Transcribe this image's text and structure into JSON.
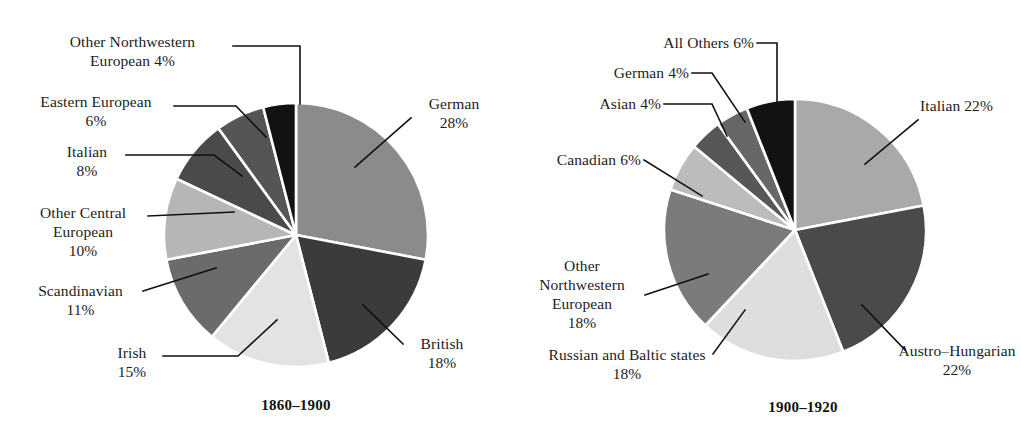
{
  "figure": {
    "background": "#ffffff",
    "leader_line_color": "#111111",
    "slice_border_color": "#ffffff",
    "text_color": "#1c1c1c"
  },
  "chart_data": [
    {
      "type": "pie",
      "title": "1860–1900",
      "xlabel": "",
      "ylabel": "",
      "legend_position": "callout-labels",
      "grid": false,
      "start_angle_deg": 0,
      "direction": "clockwise",
      "center": [
        296,
        235
      ],
      "radius": 132,
      "categories": [
        "German",
        "British",
        "Irish",
        "Scandinavian",
        "Other Central European",
        "Italian",
        "Eastern European",
        "Other Northwestern European"
      ],
      "values": [
        28,
        18,
        15,
        11,
        10,
        8,
        6,
        4
      ],
      "value_labels": [
        "28%",
        "18%",
        "15%",
        "11%",
        "10%",
        "8%",
        "6%",
        "4%"
      ],
      "colors": [
        "#8b8b8b",
        "#3b3b3b",
        "#e3e3e3",
        "#6b6b6b",
        "#b6b6b6",
        "#4a4a4a",
        "#555555",
        "#121212"
      ],
      "labels": [
        {
          "name": "German",
          "pct": "28%",
          "text": "German\n28%",
          "align": "center"
        },
        {
          "name": "British",
          "pct": "18%",
          "text": "British\n18%",
          "align": "center"
        },
        {
          "name": "Irish",
          "pct": "15%",
          "text": "Irish\n15%",
          "align": "center"
        },
        {
          "name": "Scandinavian",
          "pct": "11%",
          "text": "Scandinavian\n11%",
          "align": "center"
        },
        {
          "name": "Other Central European",
          "pct": "10%",
          "text": "Other Central\nEuropean\n10%",
          "align": "center"
        },
        {
          "name": "Italian",
          "pct": "8%",
          "text": "Italian\n8%",
          "align": "center"
        },
        {
          "name": "Eastern European",
          "pct": "6%",
          "text": "Eastern European\n6%",
          "align": "center"
        },
        {
          "name": "Other Northwestern European",
          "pct": "4%",
          "text": "Other Northwestern\nEuropean 4%",
          "align": "center"
        }
      ]
    },
    {
      "type": "pie",
      "title": "1900–1920",
      "xlabel": "",
      "ylabel": "",
      "legend_position": "callout-labels",
      "grid": false,
      "start_angle_deg": 0,
      "direction": "clockwise",
      "center": [
        795,
        230
      ],
      "radius": 131,
      "categories": [
        "Italian",
        "Austro–Hungarian",
        "Russian and Baltic states",
        "Other Northwestern European",
        "Canadian",
        "Asian",
        "German",
        "All Others"
      ],
      "values": [
        22,
        22,
        18,
        18,
        6,
        4,
        4,
        6
      ],
      "value_labels": [
        "22%",
        "22%",
        "18%",
        "18%",
        "6%",
        "4%",
        "4%",
        "6%"
      ],
      "colors": [
        "#a9a9a9",
        "#4a4a4a",
        "#dedede",
        "#7b7b7b",
        "#bcbcbc",
        "#575757",
        "#676767",
        "#121212"
      ],
      "labels": [
        {
          "name": "Italian",
          "pct": "22%",
          "text": "Italian 22%",
          "align": "left"
        },
        {
          "name": "Austro-Hungarian",
          "pct": "22%",
          "text": "Austro–Hungarian\n22%",
          "align": "center"
        },
        {
          "name": "Russian and Baltic states",
          "pct": "18%",
          "text": "Russian and Baltic states\n18%",
          "align": "center"
        },
        {
          "name": "Other Northwestern European",
          "pct": "18%",
          "text": "Other\nNorthwestern\nEuropean\n18%",
          "align": "center"
        },
        {
          "name": "Canadian",
          "pct": "6%",
          "text": "Canadian 6%",
          "align": "right"
        },
        {
          "name": "Asian",
          "pct": "4%",
          "text": "Asian 4%",
          "align": "right"
        },
        {
          "name": "German",
          "pct": "4%",
          "text": "German 4%",
          "align": "right"
        },
        {
          "name": "All Others",
          "pct": "6%",
          "text": "All Others 6%",
          "align": "right"
        }
      ]
    }
  ],
  "left_chart": {
    "caption": "1860–1900",
    "labels": {
      "other_northwestern_european": "Other Northwestern\nEuropean 4%",
      "eastern_european": "Eastern European\n6%",
      "italian": "Italian\n8%",
      "other_central_european": "Other Central\nEuropean\n10%",
      "scandinavian": "Scandinavian\n11%",
      "irish": "Irish\n15%",
      "british": "British\n18%",
      "german": "German\n28%"
    }
  },
  "right_chart": {
    "caption": "1900–1920",
    "labels": {
      "all_others": "All Others 6%",
      "german": "German 4%",
      "asian": "Asian 4%",
      "canadian": "Canadian 6%",
      "other_northwestern_european": "Other\nNorthwestern\nEuropean\n18%",
      "russian_and_baltic_states": "Russian and Baltic states\n18%",
      "austro_hungarian": "Austro–Hungarian\n22%",
      "italian": "Italian 22%"
    }
  }
}
